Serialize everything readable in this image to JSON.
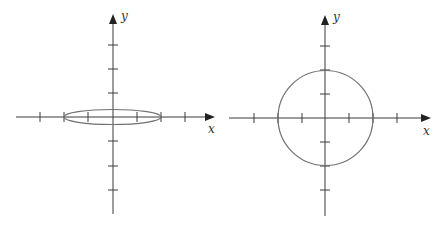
{
  "figure": {
    "panels": [
      {
        "id": "left",
        "x_label": "x",
        "y_label": "y",
        "shape": "ellipse",
        "description": "flattened ellipse centered at origin, x-radius 2, small y-radius",
        "x_ticks": [
          -3,
          -2,
          -1,
          1,
          2,
          3
        ],
        "y_ticks": [
          -3,
          -2,
          -1,
          1,
          2,
          3
        ],
        "semi_axes": {
          "a": 2,
          "b": 0.3
        }
      },
      {
        "id": "right",
        "x_label": "x",
        "y_label": "y",
        "shape": "circle",
        "description": "circle centered at origin with radius 2",
        "x_ticks": [
          -3,
          -2,
          -1,
          1,
          2,
          3
        ],
        "y_ticks": [
          -3,
          -2,
          -1,
          1,
          2,
          3
        ],
        "radius": 2
      }
    ],
    "colors": {
      "axis": "#3a3a3a",
      "curve": "#707070",
      "background": "#ffffff"
    }
  }
}
